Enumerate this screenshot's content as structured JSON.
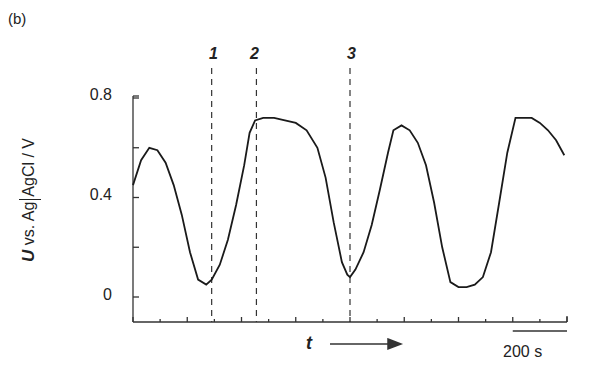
{
  "panel_label": "(b)",
  "chart_data": {
    "type": "line",
    "title": "",
    "xlabel": "t",
    "ylabel": "U vs. Ag|AgCl / V",
    "ylim": [
      -0.13,
      0.82
    ],
    "yticks": [
      0,
      0.4,
      0.8
    ],
    "ytick_labels": [
      "0",
      "0.4",
      "0.8"
    ],
    "x_units": "s",
    "x_range_s": [
      0,
      1600
    ],
    "grid": false,
    "legend": null,
    "scale_bar": {
      "label": "200 s",
      "length_s": 200
    },
    "markers": [
      {
        "label": "1",
        "x_s": 290
      },
      {
        "label": "2",
        "x_s": 455
      },
      {
        "label": "3",
        "x_s": 800
      }
    ],
    "series": [
      {
        "name": "U",
        "x": [
          0,
          30,
          60,
          90,
          120,
          150,
          180,
          210,
          240,
          270,
          290,
          320,
          350,
          380,
          410,
          430,
          450,
          480,
          520,
          560,
          600,
          640,
          680,
          710,
          740,
          770,
          790,
          800,
          820,
          850,
          880,
          910,
          940,
          960,
          990,
          1020,
          1050,
          1080,
          1110,
          1140,
          1170,
          1200,
          1230,
          1260,
          1290,
          1320,
          1350,
          1380,
          1410,
          1440,
          1470,
          1500,
          1530,
          1560,
          1590
        ],
        "y": [
          0.45,
          0.55,
          0.6,
          0.59,
          0.54,
          0.45,
          0.33,
          0.18,
          0.07,
          0.05,
          0.07,
          0.13,
          0.23,
          0.37,
          0.53,
          0.66,
          0.71,
          0.72,
          0.72,
          0.71,
          0.7,
          0.67,
          0.6,
          0.48,
          0.3,
          0.14,
          0.09,
          0.08,
          0.11,
          0.18,
          0.29,
          0.43,
          0.58,
          0.67,
          0.69,
          0.67,
          0.62,
          0.53,
          0.38,
          0.2,
          0.06,
          0.04,
          0.04,
          0.05,
          0.08,
          0.18,
          0.38,
          0.58,
          0.72,
          0.72,
          0.72,
          0.7,
          0.67,
          0.63,
          0.57
        ]
      }
    ]
  }
}
